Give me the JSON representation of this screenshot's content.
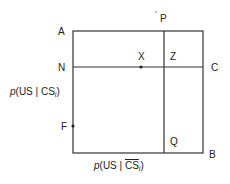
{
  "diagram": {
    "points": {
      "A": "A",
      "N": "N",
      "F": "F",
      "X": "X",
      "Z": "Z",
      "P": "P",
      "C": "C",
      "Q": "Q",
      "B": "B"
    },
    "y_axis_label": {
      "p": "p",
      "open": "(US | CS",
      "sub": "i",
      "close": ")"
    },
    "x_axis_label": {
      "p": "p",
      "open": "(US | ",
      "cs_bar": "CS",
      "sub": "i",
      "close": ")"
    },
    "colors": {
      "line": "#333333",
      "background": "#ffffff"
    }
  }
}
